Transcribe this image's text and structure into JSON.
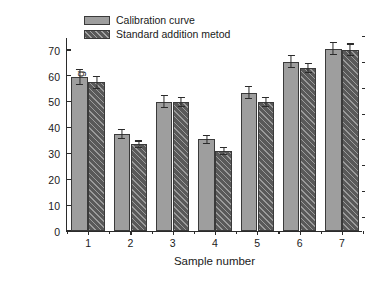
{
  "chart_data": {
    "type": "bar",
    "title": "",
    "xlabel": "Sample number",
    "ylabel": "Tomatine in tomatoes, mg/kg",
    "categories": [
      "1",
      "2",
      "3",
      "4",
      "5",
      "6",
      "7"
    ],
    "ylim": [
      0,
      75
    ],
    "yticks": [
      0,
      10,
      20,
      30,
      40,
      50,
      60,
      70
    ],
    "grid": false,
    "legend_position": "top-left",
    "series": [
      {
        "name": "Calibration curve",
        "color": "#9e9e9e",
        "pattern": "solid",
        "values": [
          59.5,
          37.5,
          50.0,
          35.5,
          53.5,
          65.5,
          70.5
        ],
        "errors": [
          3.0,
          1.8,
          2.5,
          1.8,
          2.5,
          2.5,
          2.5
        ]
      },
      {
        "name": "Standard addition metod",
        "color": "#595959",
        "pattern": "diagonal-hatch",
        "values": [
          57.5,
          33.5,
          50.0,
          31.0,
          50.0,
          63.0,
          70.0
        ],
        "errors": [
          2.5,
          1.5,
          2.0,
          1.5,
          2.0,
          2.0,
          2.5
        ]
      }
    ]
  }
}
